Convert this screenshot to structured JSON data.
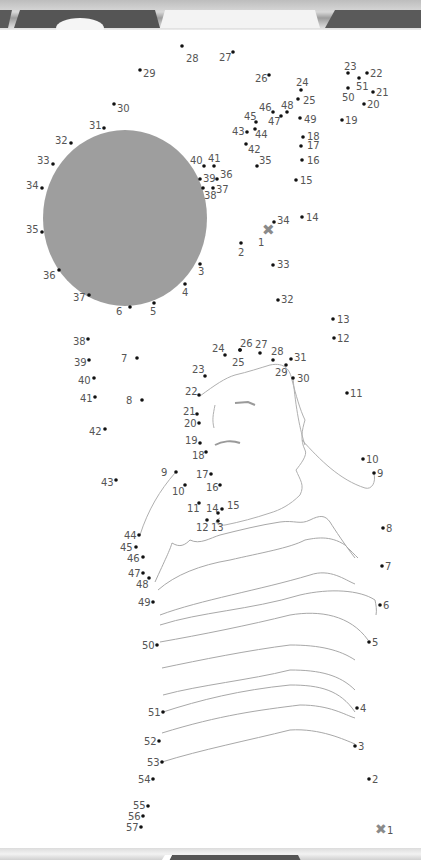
{
  "page": {
    "kind": "connect-the-dots worksheet",
    "colors": {
      "sun_fill": "#9e9e9e",
      "dot": "#111111",
      "label": "#555555",
      "outline": "#aaaaaa",
      "start_marker": "#8a8a8a"
    }
  },
  "puzzles": {
    "upper": {
      "start_marker": {
        "label": "1",
        "x": 267,
        "y": 230
      },
      "dots": [
        {
          "n": "2",
          "x": 241,
          "y": 243,
          "lx": 238,
          "ly": 256
        },
        {
          "n": "3",
          "x": 200,
          "y": 264,
          "lx": 198,
          "ly": 275
        },
        {
          "n": "4",
          "x": 185,
          "y": 284,
          "lx": 182,
          "ly": 296
        },
        {
          "n": "5",
          "x": 154,
          "y": 303,
          "lx": 150,
          "ly": 315
        },
        {
          "n": "6",
          "x": 130,
          "y": 307,
          "lx": 116,
          "ly": 315
        },
        {
          "n": "37",
          "x": 89,
          "y": 295,
          "lx": 73,
          "ly": 301
        },
        {
          "n": "36",
          "x": 59,
          "y": 270,
          "lx": 43,
          "ly": 279
        },
        {
          "n": "35",
          "x": 42,
          "y": 232,
          "lx": 26,
          "ly": 233
        },
        {
          "n": "34",
          "x": 42,
          "y": 188,
          "lx": 26,
          "ly": 189
        },
        {
          "n": "33",
          "x": 53,
          "y": 164,
          "lx": 37,
          "ly": 164
        },
        {
          "n": "32",
          "x": 71,
          "y": 143,
          "lx": 55,
          "ly": 144
        },
        {
          "n": "31",
          "x": 104,
          "y": 128,
          "lx": 89,
          "ly": 129
        },
        {
          "n": "30",
          "x": 114,
          "y": 104,
          "lx": 117,
          "ly": 112
        },
        {
          "n": "29",
          "x": 140,
          "y": 70,
          "lx": 143,
          "ly": 77
        },
        {
          "n": "28",
          "x": 182,
          "y": 46,
          "lx": 186,
          "ly": 62
        },
        {
          "n": "27",
          "x": 233,
          "y": 52,
          "lx": 219,
          "ly": 61
        },
        {
          "n": "26",
          "x": 269,
          "y": 75,
          "lx": 255,
          "ly": 82
        },
        {
          "n": "24",
          "x": 301,
          "y": 90,
          "lx": 296,
          "ly": 86
        },
        {
          "n": "25",
          "x": 298,
          "y": 99,
          "lx": 303,
          "ly": 104
        },
        {
          "n": "46",
          "x": 273,
          "y": 112,
          "lx": 259,
          "ly": 111
        },
        {
          "n": "48",
          "x": 287,
          "y": 112,
          "lx": 281,
          "ly": 109
        },
        {
          "n": "47",
          "x": 281,
          "y": 116,
          "lx": 268,
          "ly": 125
        },
        {
          "n": "45",
          "x": 256,
          "y": 122,
          "lx": 244,
          "ly": 120
        },
        {
          "n": "49",
          "x": 300,
          "y": 118,
          "lx": 304,
          "ly": 123
        },
        {
          "n": "43",
          "x": 247,
          "y": 132,
          "lx": 232,
          "ly": 135
        },
        {
          "n": "44",
          "x": 255,
          "y": 129,
          "lx": 255,
          "ly": 138
        },
        {
          "n": "42",
          "x": 246,
          "y": 144,
          "lx": 248,
          "ly": 153
        },
        {
          "n": "18",
          "x": 303,
          "y": 137,
          "lx": 307,
          "ly": 140
        },
        {
          "n": "17",
          "x": 301,
          "y": 146,
          "lx": 307,
          "ly": 149
        },
        {
          "n": "35b",
          "x": 257,
          "y": 166,
          "lx": 259,
          "ly": 164
        },
        {
          "n": "16",
          "x": 302,
          "y": 160,
          "lx": 307,
          "ly": 164
        },
        {
          "n": "40",
          "x": 204,
          "y": 166,
          "lx": 190,
          "ly": 164
        },
        {
          "n": "41",
          "x": 214,
          "y": 166,
          "lx": 208,
          "ly": 162
        },
        {
          "n": "39",
          "x": 200,
          "y": 179,
          "lx": 203,
          "ly": 182
        },
        {
          "n": "36b",
          "x": 217,
          "y": 179,
          "lx": 220,
          "ly": 178
        },
        {
          "n": "38",
          "x": 203,
          "y": 188,
          "lx": 204,
          "ly": 199
        },
        {
          "n": "37b",
          "x": 213,
          "y": 188,
          "lx": 216,
          "ly": 193
        },
        {
          "n": "15",
          "x": 296,
          "y": 180,
          "lx": 300,
          "ly": 184
        },
        {
          "n": "14",
          "x": 302,
          "y": 217,
          "lx": 306,
          "ly": 221
        },
        {
          "n": "34b",
          "x": 274,
          "y": 222,
          "lx": 277,
          "ly": 224
        },
        {
          "n": "33b",
          "x": 273,
          "y": 265,
          "lx": 277,
          "ly": 268
        },
        {
          "n": "32b",
          "x": 278,
          "y": 300,
          "lx": 281,
          "ly": 303
        },
        {
          "n": "19",
          "x": 342,
          "y": 120,
          "lx": 345,
          "ly": 124
        },
        {
          "n": "20",
          "x": 364,
          "y": 104,
          "lx": 367,
          "ly": 108
        },
        {
          "n": "21",
          "x": 373,
          "y": 92,
          "lx": 376,
          "ly": 96
        },
        {
          "n": "22",
          "x": 367,
          "y": 73,
          "lx": 370,
          "ly": 77
        },
        {
          "n": "23",
          "x": 348,
          "y": 73,
          "lx": 344,
          "ly": 70
        },
        {
          "n": "51",
          "x": 359,
          "y": 78,
          "lx": 356,
          "ly": 90
        },
        {
          "n": "50",
          "x": 348,
          "y": 88,
          "lx": 342,
          "ly": 101
        }
      ],
      "labels_display": {
        "35b": "35",
        "36b": "36",
        "37b": "37",
        "34b": "34",
        "33b": "33",
        "32b": "32"
      }
    },
    "lower": {
      "start_marker": {
        "label": "1",
        "x": 380,
        "y": 829
      },
      "dots": [
        {
          "n": "2",
          "x": 369,
          "y": 779,
          "lx": 372,
          "ly": 783
        },
        {
          "n": "3",
          "x": 355,
          "y": 746,
          "lx": 358,
          "ly": 750
        },
        {
          "n": "4",
          "x": 357,
          "y": 708,
          "lx": 360,
          "ly": 712
        },
        {
          "n": "5",
          "x": 369,
          "y": 642,
          "lx": 372,
          "ly": 646
        },
        {
          "n": "6",
          "x": 380,
          "y": 605,
          "lx": 383,
          "ly": 609
        },
        {
          "n": "7",
          "x": 382,
          "y": 566,
          "lx": 385,
          "ly": 570
        },
        {
          "n": "8",
          "x": 383,
          "y": 528,
          "lx": 386,
          "ly": 532
        },
        {
          "n": "9",
          "x": 374,
          "y": 473,
          "lx": 377,
          "ly": 477
        },
        {
          "n": "10",
          "x": 363,
          "y": 459,
          "lx": 366,
          "ly": 463
        },
        {
          "n": "11",
          "x": 347,
          "y": 393,
          "lx": 350,
          "ly": 397
        },
        {
          "n": "12",
          "x": 334,
          "y": 338,
          "lx": 337,
          "ly": 342
        },
        {
          "n": "13",
          "x": 333,
          "y": 319,
          "lx": 337,
          "ly": 323
        },
        {
          "n": "31",
          "x": 291,
          "y": 359,
          "lx": 294,
          "ly": 361
        },
        {
          "n": "30",
          "x": 293,
          "y": 378,
          "lx": 297,
          "ly": 382
        },
        {
          "n": "29",
          "x": 286,
          "y": 365,
          "lx": 275,
          "ly": 376
        },
        {
          "n": "28",
          "x": 273,
          "y": 360,
          "lx": 271,
          "ly": 355
        },
        {
          "n": "27",
          "x": 260,
          "y": 353,
          "lx": 255,
          "ly": 348
        },
        {
          "n": "26",
          "x": 240,
          "y": 350,
          "lx": 240,
          "ly": 347
        },
        {
          "n": "25",
          "x": 240,
          "y": 350,
          "lx": 232,
          "ly": 366
        },
        {
          "n": "24",
          "x": 225,
          "y": 355,
          "lx": 212,
          "ly": 352
        },
        {
          "n": "23",
          "x": 205,
          "y": 376,
          "lx": 192,
          "ly": 373
        },
        {
          "n": "22",
          "x": 199,
          "y": 395,
          "lx": 185,
          "ly": 395
        },
        {
          "n": "21",
          "x": 197,
          "y": 414,
          "lx": 183,
          "ly": 415
        },
        {
          "n": "20",
          "x": 199,
          "y": 423,
          "lx": 184,
          "ly": 427
        },
        {
          "n": "19",
          "x": 200,
          "y": 443,
          "lx": 185,
          "ly": 444
        },
        {
          "n": "18",
          "x": 206,
          "y": 452,
          "lx": 192,
          "ly": 459
        },
        {
          "n": "17",
          "x": 211,
          "y": 474,
          "lx": 196,
          "ly": 478
        },
        {
          "n": "16",
          "x": 220,
          "y": 485,
          "lx": 206,
          "ly": 491
        },
        {
          "n": "15",
          "x": 222,
          "y": 509,
          "lx": 227,
          "ly": 509
        },
        {
          "n": "14",
          "x": 218,
          "y": 513,
          "lx": 206,
          "ly": 512
        },
        {
          "n": "11",
          "x": 199,
          "y": 503,
          "lx": 187,
          "ly": 512
        },
        {
          "n": "12",
          "x": 207,
          "y": 520,
          "lx": 196,
          "ly": 531
        },
        {
          "n": "13",
          "x": 218,
          "y": 521,
          "lx": 211,
          "ly": 531
        },
        {
          "n": "10",
          "x": 185,
          "y": 485,
          "lx": 172,
          "ly": 495
        },
        {
          "n": "9",
          "x": 176,
          "y": 472,
          "lx": 161,
          "ly": 476
        },
        {
          "n": "7",
          "x": 137,
          "y": 358,
          "lx": 121,
          "ly": 362
        },
        {
          "n": "8",
          "x": 142,
          "y": 400,
          "lx": 126,
          "ly": 404
        },
        {
          "n": "38",
          "x": 88,
          "y": 339,
          "lx": 73,
          "ly": 345
        },
        {
          "n": "39",
          "x": 89,
          "y": 360,
          "lx": 74,
          "ly": 366
        },
        {
          "n": "40",
          "x": 94,
          "y": 378,
          "lx": 78,
          "ly": 384
        },
        {
          "n": "41",
          "x": 95,
          "y": 397,
          "lx": 80,
          "ly": 402
        },
        {
          "n": "42",
          "x": 105,
          "y": 429,
          "lx": 89,
          "ly": 435
        },
        {
          "n": "43",
          "x": 116,
          "y": 480,
          "lx": 101,
          "ly": 486
        },
        {
          "n": "44",
          "x": 139,
          "y": 535,
          "lx": 124,
          "ly": 539
        },
        {
          "n": "45",
          "x": 136,
          "y": 547,
          "lx": 120,
          "ly": 551
        },
        {
          "n": "46",
          "x": 143,
          "y": 557,
          "lx": 127,
          "ly": 562
        },
        {
          "n": "47",
          "x": 143,
          "y": 573,
          "lx": 128,
          "ly": 577
        },
        {
          "n": "48",
          "x": 149,
          "y": 578,
          "lx": 136,
          "ly": 588
        },
        {
          "n": "49",
          "x": 153,
          "y": 602,
          "lx": 138,
          "ly": 606
        },
        {
          "n": "50",
          "x": 157,
          "y": 645,
          "lx": 142,
          "ly": 649
        },
        {
          "n": "51",
          "x": 163,
          "y": 712,
          "lx": 148,
          "ly": 716
        },
        {
          "n": "52",
          "x": 159,
          "y": 741,
          "lx": 144,
          "ly": 745
        },
        {
          "n": "53",
          "x": 162,
          "y": 762,
          "lx": 147,
          "ly": 766
        },
        {
          "n": "54",
          "x": 153,
          "y": 779,
          "lx": 138,
          "ly": 783
        },
        {
          "n": "55",
          "x": 148,
          "y": 806,
          "lx": 133,
          "ly": 809
        },
        {
          "n": "56",
          "x": 143,
          "y": 816,
          "lx": 128,
          "ly": 820
        },
        {
          "n": "57",
          "x": 141,
          "y": 827,
          "lx": 126,
          "ly": 831
        }
      ]
    }
  }
}
